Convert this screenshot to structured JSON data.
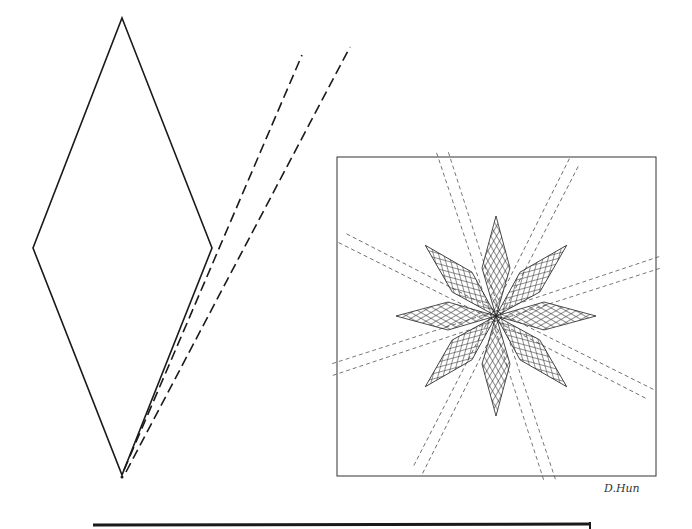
{
  "figure": {
    "template_piece": {
      "shape": "diamond",
      "seam_lines": "dashed"
    },
    "star_block": {
      "points": 8,
      "fill": "crosshatch",
      "frame": "square"
    },
    "signature": "D.Hun",
    "colors": {
      "ink": "#1a1a1a",
      "paper": "#ffffff"
    }
  }
}
